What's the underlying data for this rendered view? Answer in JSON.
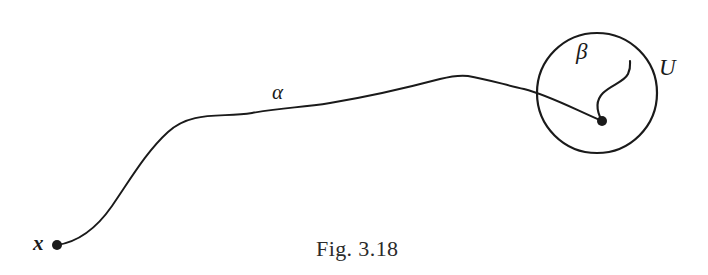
{
  "figure": {
    "caption": "Fig. 3.18",
    "background_color": "#ffffff",
    "ink_color": "#1a1a1a",
    "width": 708,
    "height": 275,
    "labels": {
      "alpha": "α",
      "beta": "β",
      "neighborhood": "U",
      "basepoint": "x"
    },
    "elements": {
      "alpha_path_name": "alpha-path",
      "beta_path_name": "beta-path",
      "circle_name": "neighborhood-circle",
      "start_point_name": "start-point-x",
      "end_point_name": "end-point-basepoint"
    },
    "geometry": {
      "circle_center_x": 597,
      "circle_center_y": 93,
      "circle_radius": 60,
      "start_dot_x": 57,
      "start_dot_y": 245,
      "end_dot_x": 602,
      "end_dot_y": 121,
      "dot_radius": 5,
      "stroke_width": 1.9
    }
  }
}
